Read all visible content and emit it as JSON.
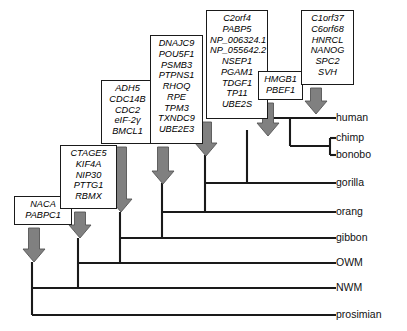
{
  "figure": {
    "type": "phylogenetic-tree-with-gene-gain-annotations",
    "width": 407,
    "height": 331,
    "background": "#ffffff",
    "line_color": "#1a1a1a",
    "arrow_color": "#808080",
    "arrow_outline": "#555555"
  },
  "tips": [
    {
      "id": "human",
      "label": "human",
      "x": 336,
      "y": 118
    },
    {
      "id": "chimp",
      "label": "chimp",
      "x": 336,
      "y": 138
    },
    {
      "id": "bonobo",
      "label": "bonobo",
      "x": 336,
      "y": 155
    },
    {
      "id": "gorilla",
      "label": "gorilla",
      "x": 336,
      "y": 183
    },
    {
      "id": "orang",
      "label": "orang",
      "x": 336,
      "y": 212
    },
    {
      "id": "gibbon",
      "label": "gibbon",
      "x": 336,
      "y": 238
    },
    {
      "id": "owm",
      "label": "OWM",
      "x": 336,
      "y": 263
    },
    {
      "id": "nwm",
      "label": "NWM",
      "x": 336,
      "y": 288
    },
    {
      "id": "prosimian",
      "label": "prosimian",
      "x": 336,
      "y": 315
    }
  ],
  "gene_boxes": [
    {
      "id": "box-nodeA-naca",
      "node": "anthropoid-ancestor",
      "x": 14,
      "y": 196,
      "w": 58,
      "h": 29,
      "font_size": 9.2,
      "genes": [
        "NACA",
        "PABPC1"
      ]
    },
    {
      "id": "box-nodeB-ctage5",
      "node": "catarrhine-ancestor",
      "x": 60,
      "y": 145,
      "w": 57,
      "h": 64,
      "font_size": 9.2,
      "genes": [
        "CTAGE5",
        "KIF4A",
        "NIP30",
        "PTTG1",
        "RBMX"
      ]
    },
    {
      "id": "box-nodeC-adh5",
      "node": "hominoid-ancestor",
      "x": 101,
      "y": 80,
      "w": 53,
      "h": 64,
      "font_size": 9.2,
      "genes": [
        "ADH5",
        "CDC14B",
        "CDC2",
        "eIF-2γ",
        "BMCL1"
      ]
    },
    {
      "id": "box-nodeD-dnajc9",
      "node": "great-ape-ancestor",
      "x": 150,
      "y": 35,
      "w": 53,
      "h": 109,
      "font_size": 9.2,
      "genes": [
        "DNAJC9",
        "POU5F1",
        "PSMB3",
        "PTPNS1",
        "RHOQ",
        "RPE",
        "TPM3",
        "TXNDC9",
        "UBE2E3"
      ]
    },
    {
      "id": "box-nodeE-c2orf4",
      "node": "african-ape-ancestor",
      "x": 206,
      "y": 10,
      "w": 62,
      "h": 109,
      "font_size": 9.2,
      "genes": [
        "C2orf4",
        "PABP5",
        "NP_006324.1",
        "NP_055642.2",
        "NSEP1",
        "PGAM1",
        "TDGF1",
        "TP11",
        "UBE2S"
      ]
    },
    {
      "id": "box-nodeF-hmgb1",
      "node": "homo-pan-ancestor",
      "x": 258,
      "y": 71,
      "w": 45,
      "h": 29,
      "font_size": 9.2,
      "genes": [
        "HMGB1",
        "PBEF1"
      ]
    },
    {
      "id": "box-nodeG-c1orf37",
      "node": "human-lineage",
      "x": 301,
      "y": 10,
      "w": 53,
      "h": 75,
      "font_size": 9.2,
      "genes": [
        "C1orf37",
        "C6orf68",
        "HNRCL",
        "NANOG",
        "SPC2",
        "SVH"
      ]
    }
  ],
  "arrows": [
    {
      "id": "arrow-naca",
      "x": 34,
      "y_top": 228,
      "y_bottom": 262,
      "w": 22
    },
    {
      "id": "arrow-ctage5",
      "x": 80,
      "y_top": 212,
      "y_bottom": 238,
      "w": 22
    },
    {
      "id": "arrow-adh5",
      "x": 121,
      "y_top": 147,
      "y_bottom": 212,
      "w": 22
    },
    {
      "id": "arrow-dnajc9",
      "x": 163,
      "y_top": 147,
      "y_bottom": 184,
      "w": 22
    },
    {
      "id": "arrow-c2orf4",
      "x": 206,
      "y_top": 122,
      "y_bottom": 156,
      "w": 22
    },
    {
      "id": "arrow-hmgb1",
      "x": 268,
      "y_top": 103,
      "y_bottom": 136,
      "w": 22
    },
    {
      "id": "arrow-c1orf37",
      "x": 316,
      "y_top": 88,
      "y_bottom": 114,
      "w": 22
    }
  ],
  "tree_edges": {
    "description": "rectangular cladogram, root at left",
    "nodes": [
      {
        "id": "root-prosimian",
        "x": 32,
        "y_top": 262,
        "y_bottom": 315
      },
      {
        "id": "node-nwm",
        "x": 78,
        "y_top": 238,
        "y_bottom": 288
      },
      {
        "id": "node-owm",
        "x": 120,
        "y_top": 212,
        "y_bottom": 263
      },
      {
        "id": "node-gibbon",
        "x": 162,
        "y_top": 183,
        "y_bottom": 238
      },
      {
        "id": "node-orang",
        "x": 205,
        "y_top": 155,
        "y_bottom": 212
      },
      {
        "id": "node-gorilla",
        "x": 247,
        "y_top": 130,
        "y_bottom": 183
      },
      {
        "id": "node-homo-pan",
        "x": 290,
        "y_top": 118,
        "y_bottom": 146
      },
      {
        "id": "node-chimp-bon",
        "x": 330,
        "y_top": 138,
        "y_bottom": 155
      }
    ]
  },
  "chart_data": {
    "type": "tree",
    "title": "",
    "taxa": [
      "human",
      "chimp",
      "bonobo",
      "gorilla",
      "orang",
      "gibbon",
      "OWM",
      "NWM",
      "prosimian"
    ],
    "newick": "(prosimian,(NWM,(OWM,(gibbon,(orang,(gorilla,(human,(chimp,bonobo))))))));",
    "node_annotations": [
      {
        "node": "anthropoid-ancestor",
        "genes": [
          "NACA",
          "PABPC1"
        ]
      },
      {
        "node": "catarrhine-ancestor",
        "genes": [
          "CTAGE5",
          "KIF4A",
          "NIP30",
          "PTTG1",
          "RBMX"
        ]
      },
      {
        "node": "hominoid-ancestor",
        "genes": [
          "ADH5",
          "CDC14B",
          "CDC2",
          "eIF-2γ",
          "BMCL1"
        ]
      },
      {
        "node": "great-ape-ancestor",
        "genes": [
          "DNAJC9",
          "POU5F1",
          "PSMB3",
          "PTPNS1",
          "RHOQ",
          "RPE",
          "TPM3",
          "TXNDC9",
          "UBE2E3"
        ]
      },
      {
        "node": "african-ape-ancestor",
        "genes": [
          "C2orf4",
          "PABP5",
          "NP_006324.1",
          "NP_055642.2",
          "NSEP1",
          "PGAM1",
          "TDGF1",
          "TP11",
          "UBE2S"
        ]
      },
      {
        "node": "homo-pan-ancestor",
        "genes": [
          "HMGB1",
          "PBEF1"
        ]
      },
      {
        "node": "human-lineage",
        "genes": [
          "C1orf37",
          "C6orf68",
          "HNRCL",
          "NANOG",
          "SPC2",
          "SVH"
        ]
      }
    ]
  }
}
